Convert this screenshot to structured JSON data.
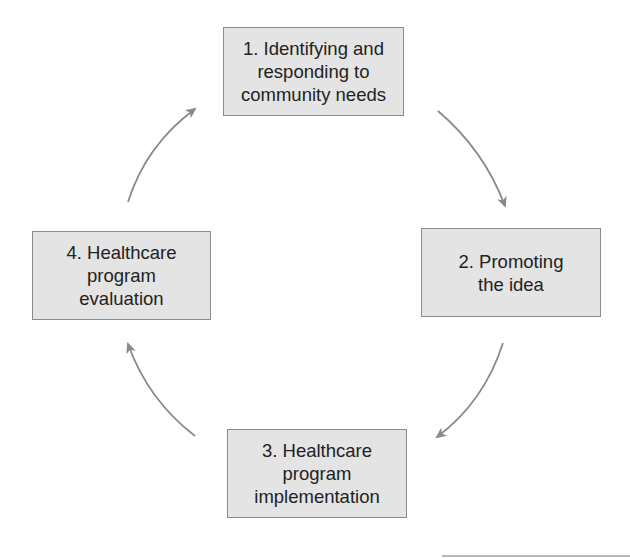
{
  "diagram": {
    "type": "cycle",
    "steps": [
      {
        "id": 1,
        "label": "1. Identifying and\nresponding to\ncommunity needs"
      },
      {
        "id": 2,
        "label": "2. Promoting\nthe idea"
      },
      {
        "id": 3,
        "label": "3. Healthcare\nprogram\nimplementation"
      },
      {
        "id": 4,
        "label": "4. Healthcare\nprogram\nevaluation"
      }
    ],
    "connections": [
      {
        "from": 1,
        "to": 2,
        "direction": "clockwise"
      },
      {
        "from": 2,
        "to": 3,
        "direction": "clockwise"
      },
      {
        "from": 3,
        "to": 4,
        "direction": "clockwise"
      },
      {
        "from": 4,
        "to": 1,
        "direction": "clockwise"
      }
    ],
    "colors": {
      "box_fill": "#e4e4e4",
      "box_border": "#8c8c8c",
      "text": "#222222",
      "arrow": "#8a8a8a"
    }
  }
}
